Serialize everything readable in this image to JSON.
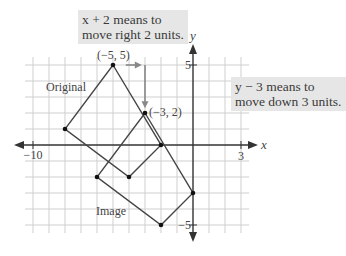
{
  "callouts": {
    "x_shift": {
      "line1": "x + 2 means to",
      "line2": "move right 2 units."
    },
    "y_shift": {
      "line1": "y − 3 means to",
      "line2": "move down 3 units."
    }
  },
  "labels": {
    "original": "Original",
    "image": "Image",
    "point_top": "(−5, 5)",
    "point_image": "(−3, 2)",
    "x_axis": "x",
    "y_axis": "y",
    "tick_x_min": "−10",
    "tick_x_max": "3",
    "tick_y_max": "5",
    "tick_y_min": "−5"
  },
  "grid": {
    "x_min": -10,
    "x_max": 3,
    "y_min": -5,
    "y_max": 5,
    "origin_px": [
      193,
      145
    ],
    "unit_px": 16,
    "grid_color": "#cfcfcf",
    "axis_color": "#333333",
    "shape_color": "#444444"
  },
  "shapes": {
    "original": [
      [
        -5,
        5
      ],
      [
        -2,
        0
      ],
      [
        -4,
        -2
      ],
      [
        -8,
        1
      ]
    ],
    "image": [
      [
        -3,
        2
      ],
      [
        0,
        -3
      ],
      [
        -2,
        -5
      ],
      [
        -6,
        -2
      ]
    ]
  },
  "arrows": {
    "right": {
      "from": [
        -4.2,
        5
      ],
      "to": [
        -3.2,
        5
      ],
      "color": "#888888"
    },
    "down": {
      "from": [
        -3,
        5
      ],
      "to": [
        -3,
        2.3
      ],
      "color": "#888888"
    }
  }
}
